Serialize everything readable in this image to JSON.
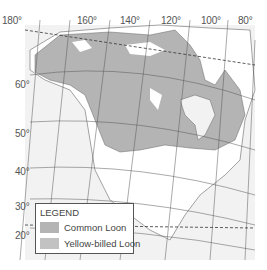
{
  "map": {
    "colors": {
      "ocean": "#f2f2f2",
      "land": "#ffffff",
      "range": "#b4b4b4",
      "grid": "#555555"
    },
    "longitude_labels": [
      {
        "text": "180°",
        "x": 9,
        "y": 14
      },
      {
        "text": "160°",
        "x": 60,
        "y": 14
      },
      {
        "text": "140°",
        "x": 113,
        "y": 14
      },
      {
        "text": "120°",
        "x": 161,
        "y": 14
      },
      {
        "text": "100°",
        "x": 202,
        "y": 14
      },
      {
        "text": "80°",
        "x": 239,
        "y": 14
      }
    ],
    "latitude_labels": [
      {
        "text": "60°",
        "x": 15,
        "y": 77
      },
      {
        "text": "50°",
        "x": 15,
        "y": 127
      },
      {
        "text": "40°",
        "x": 15,
        "y": 172
      },
      {
        "text": "30°",
        "x": 15,
        "y": 201
      },
      {
        "text": "20°",
        "x": 15,
        "y": 229
      }
    ]
  },
  "legend": {
    "title": "LEGEND",
    "items": [
      {
        "label": "Common Loon",
        "color": "#b4b4b4"
      },
      {
        "label": "Yellow-billed Loon",
        "color": "#c2c2c2"
      }
    ]
  }
}
